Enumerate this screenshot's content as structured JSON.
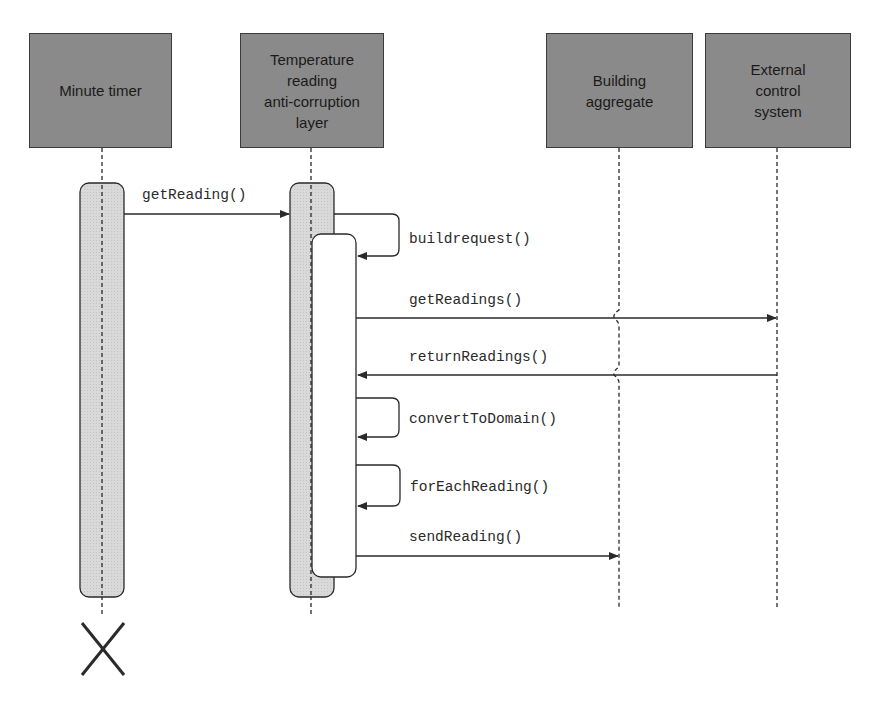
{
  "diagram": {
    "type": "sequence",
    "participants": [
      {
        "id": "minute_timer",
        "label": "Minute timer"
      },
      {
        "id": "acl",
        "label": "Temperature\nreading\nanti-corruption\nlayer"
      },
      {
        "id": "building",
        "label": "Building\naggregate"
      },
      {
        "id": "external",
        "label": "External\ncontrol\nsystem"
      }
    ],
    "messages": [
      {
        "from": "minute_timer",
        "to": "acl",
        "label": "getReading()"
      },
      {
        "from": "acl",
        "to": "acl",
        "label": "buildrequest()"
      },
      {
        "from": "acl",
        "to": "external",
        "label": "getReadings()"
      },
      {
        "from": "external",
        "to": "acl",
        "label": "returnReadings()"
      },
      {
        "from": "acl",
        "to": "acl",
        "label": "convertToDomain()"
      },
      {
        "from": "acl",
        "to": "acl",
        "label": "forEachReading()"
      },
      {
        "from": "acl",
        "to": "building",
        "label": "sendReading()"
      }
    ],
    "destroy_marker": {
      "participant": "minute_timer",
      "symbol": "X"
    }
  },
  "colors": {
    "participant_fill": "#8a8a8a",
    "activation_fill": "#d6d6d6",
    "line": "#2a2a2a"
  }
}
